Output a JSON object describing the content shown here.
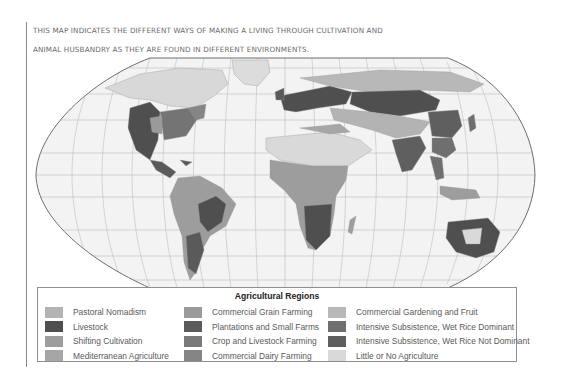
{
  "caption": {
    "line1": "This map indicates the different ways of making a living through cultivation and",
    "line2": "animal husbandry as they are found in different environments."
  },
  "map": {
    "projection": "Robinson",
    "ocean_color": "#f2f2f2",
    "graticule_color": "#b9b9b9",
    "outline_color": "#6e6e6e"
  },
  "legend": {
    "title": "Agricultural Regions",
    "columns": [
      {
        "items": [
          {
            "label": "Pastoral Nomadism",
            "color": "#b3b3b3"
          },
          {
            "label": "Livestock",
            "color": "#4f4f4f"
          },
          {
            "label": "Shifting Cultivation",
            "color": "#9d9d9d"
          },
          {
            "label": "Mediterranean Agriculture",
            "color": "#a6a6a6"
          }
        ]
      },
      {
        "items": [
          {
            "label": "Commercial Grain Farming",
            "color": "#9a9a9a"
          },
          {
            "label": "Plantations and Small Farms",
            "color": "#5a5a5a"
          },
          {
            "label": "Crop and Livestock Farming",
            "color": "#7a7a7a"
          },
          {
            "label": "Commercial Dairy Farming",
            "color": "#858585"
          }
        ]
      },
      {
        "items": [
          {
            "label": "Commercial Gardening and Fruit",
            "color": "#b8b8b8"
          },
          {
            "label": "Intensive Subsistence, Wet Rice Dominant",
            "color": "#6f6f6f"
          },
          {
            "label": "Intensive Subsistence, Wet Rice Not Dominant",
            "color": "#5f5f5f"
          },
          {
            "label": "Little or No Agriculture",
            "color": "#d9d9d9"
          }
        ]
      }
    ]
  }
}
